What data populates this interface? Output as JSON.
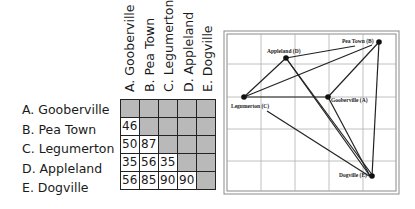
{
  "table": {
    "rows": [
      "A. Gooberville",
      "B. Pea Town",
      "C. Legumerton",
      "D. Appleland",
      "E. Dogville"
    ],
    "columns": [
      "A. Gooberville",
      "B. Pea Town",
      "C. Legumerton",
      "D. Appleland",
      "E. Dogville"
    ],
    "cells": [
      [
        "",
        "",
        "",
        "",
        ""
      ],
      [
        "46",
        "",
        "",
        "",
        ""
      ],
      [
        "50",
        "87",
        "",
        "",
        ""
      ],
      [
        "35",
        "56",
        "35",
        "",
        ""
      ],
      [
        "56",
        "85",
        "90",
        "90",
        ""
      ]
    ]
  },
  "map": {
    "nodes": {
      "A": {
        "label": "Gooberville (A)"
      },
      "B": {
        "label": "Pea Town (B)"
      },
      "C": {
        "label": "Legumerton (C)"
      },
      "D": {
        "label": "Appleland (D)"
      },
      "E": {
        "label": "Dogville (E)"
      }
    }
  },
  "colors": {
    "shaded_cell": "#b9b9b9",
    "line": "#222222",
    "grid": "#9a9a9a"
  }
}
